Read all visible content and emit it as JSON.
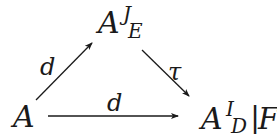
{
  "diagram": {
    "type": "commutative-triangle",
    "nodes": {
      "source": {
        "base": "A"
      },
      "top": {
        "base": "A",
        "superscript": "J",
        "subscript": "E"
      },
      "target": {
        "base": "A",
        "superscript": "I",
        "subscript": "D",
        "bar": "|",
        "suffix": "F"
      }
    },
    "edges": [
      {
        "from": "source",
        "to": "top",
        "label": "d"
      },
      {
        "from": "top",
        "to": "target",
        "label": "τ"
      },
      {
        "from": "source",
        "to": "target",
        "label": "d"
      }
    ],
    "colors": {
      "ink": "#1a1a1a",
      "background": "#ffffff"
    }
  }
}
